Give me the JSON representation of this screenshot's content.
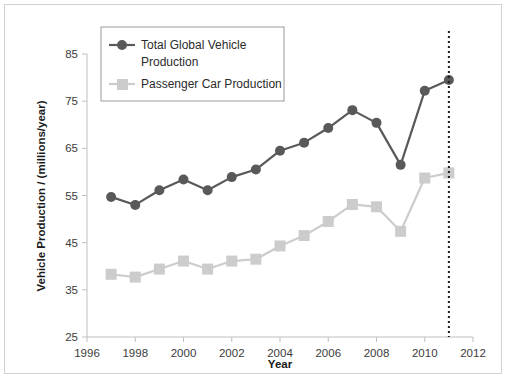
{
  "chart_data": {
    "type": "line",
    "title": "",
    "xlabel": "Year",
    "ylabel": "Vehicle Production / (millions/year)",
    "xlim": [
      1996,
      2012
    ],
    "ylim": [
      25,
      85
    ],
    "xticks": [
      1996,
      1998,
      2000,
      2002,
      2004,
      2006,
      2008,
      2010,
      2012
    ],
    "yticks": [
      25,
      35,
      45,
      55,
      65,
      75,
      85
    ],
    "grid": false,
    "legend_position": "upper-left-inside",
    "x": [
      1997,
      1998,
      1999,
      2000,
      2001,
      2002,
      2003,
      2004,
      2005,
      2006,
      2007,
      2008,
      2009,
      2010,
      2011
    ],
    "series": [
      {
        "name": "Total Global Vehicle Production",
        "color": "#595959",
        "marker": "circle",
        "values": [
          54.7,
          53.0,
          56.1,
          58.4,
          56.1,
          58.9,
          60.5,
          64.5,
          66.2,
          69.3,
          73.1,
          70.4,
          61.5,
          77.2,
          79.5
        ]
      },
      {
        "name": "Passenger Car Production",
        "color": "#cccccc",
        "marker": "square",
        "values": [
          38.3,
          37.7,
          39.4,
          41.1,
          39.4,
          41.1,
          41.5,
          44.3,
          46.5,
          49.5,
          53.1,
          52.6,
          47.4,
          58.7,
          59.8
        ]
      }
    ],
    "annotations": [
      {
        "name": "forecast-divider",
        "type": "vertical-dotted-line",
        "x": 2011,
        "color": "#1a1a1a"
      }
    ]
  },
  "legend": {
    "entries": [
      {
        "label_line1": "Total Global Vehicle",
        "label_line2": "Production",
        "swatch": "dark-circle-line-marker"
      },
      {
        "label_line1": "Passenger Car Production",
        "label_line2": "",
        "swatch": "light-square-line-marker"
      }
    ]
  },
  "axes": {
    "x_tick_labels": [
      "1996",
      "1998",
      "2000",
      "2002",
      "2004",
      "2006",
      "2008",
      "2010",
      "2012"
    ],
    "y_tick_labels": [
      "25",
      "35",
      "45",
      "55",
      "65",
      "75",
      "85"
    ],
    "x_title": "Year",
    "y_title": "Vehicle Production / (millions/year)"
  },
  "colors": {
    "series_dark": "#595959",
    "series_light": "#cccccc",
    "axis": "#bfbfbf",
    "frame": "#d2d2d2",
    "text": "#3b3b3b"
  }
}
